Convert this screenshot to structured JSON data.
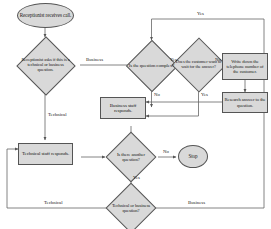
{
  "diagram": {
    "colors": {
      "node_fill": "#d9d9d9",
      "node_stroke": "#555555",
      "connector": "#666666",
      "text": "#1a1a1a",
      "background": "#ffffff"
    }
  },
  "nodes": {
    "start": {
      "label": "Receptionist receives call.",
      "shape": "oval",
      "type": "terminator"
    },
    "triage": {
      "label": "Receptionist asks if this is a technical or business question.",
      "shape": "diamond",
      "type": "decision"
    },
    "complex": {
      "label": "Is the question complex?",
      "shape": "diamond",
      "type": "decision"
    },
    "wait": {
      "label": "Does the customer want to wait for the answer?",
      "shape": "diamond",
      "type": "decision"
    },
    "write_number": {
      "label": "Write down the telephone number of the customer.",
      "shape": "rectangle",
      "type": "process"
    },
    "research": {
      "label": "Research answer to the question.",
      "shape": "rectangle",
      "type": "process"
    },
    "business_staff": {
      "label": "Business staff responds.",
      "shape": "rectangle",
      "type": "process"
    },
    "technical_staff": {
      "label": "Technical staff responds.",
      "shape": "rectangle",
      "type": "process"
    },
    "another": {
      "label": "Is there another question?",
      "shape": "diamond",
      "type": "decision"
    },
    "stop": {
      "label": "Stop",
      "shape": "oval",
      "type": "terminator"
    },
    "tech_or_bus": {
      "label": "Technical or business question?",
      "shape": "diamond",
      "type": "decision"
    }
  },
  "edge_labels": {
    "triage_business": "Business",
    "triage_technical": "Technical",
    "complex_yes": "Yes",
    "complex_no": "No",
    "wait_yes": "Yes",
    "wait_no": "No",
    "research_yes": "Yes",
    "another_no": "No",
    "another_yes": "Yes",
    "loop_technical": "Technical",
    "loop_business": "Business"
  }
}
